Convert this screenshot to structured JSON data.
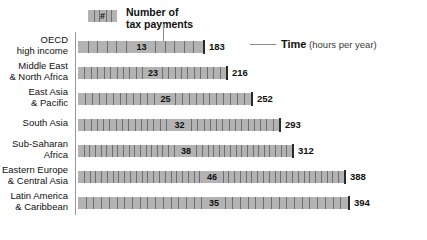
{
  "legend": {
    "swatch_symbol": "#",
    "label_line1": "Number of",
    "label_line2": "tax payments"
  },
  "time_callout": {
    "strong": "Time",
    "soft": " (hours per year)"
  },
  "colors": {
    "bar_fill": "#b3b3b3",
    "bar_tick": "#6e6e6e",
    "bar_endcap": "#2b2b2b",
    "axis": "#999999",
    "text": "#111111"
  },
  "chart_data": {
    "type": "bar",
    "title": "",
    "xlabel": "Time (hours per year)",
    "ylabel": "",
    "grid": false,
    "legend_position": "top-left",
    "xlim": [
      0,
      394
    ],
    "categories": [
      "OECD\nhigh income",
      "Middle East\n& North Africa",
      "East Asia\n& Pacific",
      "South Asia",
      "Sub-Saharan\nAfrica",
      "Eastern Europe\n& Central Asia",
      "Latin America\n& Caribbean"
    ],
    "series": [
      {
        "name": "Time (hours per year)",
        "values": [
          183,
          216,
          252,
          293,
          312,
          388,
          394
        ]
      },
      {
        "name": "Number of tax payments",
        "values": [
          13,
          23,
          25,
          32,
          38,
          46,
          35
        ]
      }
    ],
    "rows": [
      {
        "label_line1": "OECD",
        "label_line2": "high income",
        "time": 183,
        "time_text": "183",
        "payments": 13,
        "payments_text": "13"
      },
      {
        "label_line1": "Middle East",
        "label_line2": "& North Africa",
        "time": 216,
        "time_text": "216",
        "payments": 23,
        "payments_text": "23"
      },
      {
        "label_line1": "East Asia",
        "label_line2": "& Pacific",
        "time": 252,
        "time_text": "252",
        "payments": 25,
        "payments_text": "25"
      },
      {
        "label_line1": "South Asia",
        "label_line2": "",
        "time": 293,
        "time_text": "293",
        "payments": 32,
        "payments_text": "32"
      },
      {
        "label_line1": "Sub-Saharan",
        "label_line2": "Africa",
        "time": 312,
        "time_text": "312",
        "payments": 38,
        "payments_text": "38"
      },
      {
        "label_line1": "Eastern Europe",
        "label_line2": "& Central Asia",
        "time": 388,
        "time_text": "388",
        "payments": 46,
        "payments_text": "46"
      },
      {
        "label_line1": "Latin America",
        "label_line2": "& Caribbean",
        "time": 394,
        "time_text": "394",
        "payments": 35,
        "payments_text": "35"
      }
    ]
  }
}
